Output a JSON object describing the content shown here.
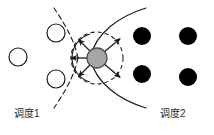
{
  "figure": {
    "background": "#ffffff",
    "width": 214,
    "height": 135
  },
  "labels": {
    "left": "调度1",
    "right": "调度2"
  },
  "colors": {
    "stroke": "#1a1a1a",
    "open_node_fill": "#ffffff",
    "filled_node_fill": "#000000",
    "center_node_fill": "#a6a6a6",
    "center_node_stroke": "#4d4d4d",
    "text": "#2b2b2b"
  },
  "nodes": {
    "open_circles": [
      {
        "id": "open-1",
        "cx": 18,
        "cy": 57,
        "r": 9
      },
      {
        "id": "open-2",
        "cx": 56,
        "cy": 33,
        "r": 9
      },
      {
        "id": "open-3",
        "cx": 56,
        "cy": 79,
        "r": 9
      }
    ],
    "filled_circles": [
      {
        "id": "filled-1",
        "cx": 142,
        "cy": 36,
        "r": 9
      },
      {
        "id": "filled-2",
        "cx": 188,
        "cy": 36,
        "r": 9
      },
      {
        "id": "filled-3",
        "cx": 142,
        "cy": 74,
        "r": 9
      },
      {
        "id": "filled-4",
        "cx": 188,
        "cy": 77,
        "r": 9
      }
    ],
    "center_circle": {
      "id": "center",
      "cx": 97,
      "cy": 58,
      "r": 10
    }
  },
  "center_ring": {
    "rx": 26,
    "ry": 26,
    "dash": "4 3"
  },
  "inner_arc": {
    "description": "solid arc left of center node",
    "rx": 25,
    "ry": 25
  },
  "arrows": [
    {
      "id": "arrow-left",
      "angle_deg": 180,
      "length": 26
    },
    {
      "id": "arrow-upper-left",
      "angle_deg": 135,
      "length": 26
    },
    {
      "id": "arrow-lower-left",
      "angle_deg": 225,
      "length": 26
    },
    {
      "id": "arrow-upper-right",
      "angle_deg": 40,
      "length": 30
    },
    {
      "id": "arrow-lower-right",
      "angle_deg": 320,
      "length": 30
    }
  ],
  "curves": {
    "solid": {
      "style": "solid",
      "description": "hyperbola-like branch opening leftward, vertex right of center"
    },
    "dashed": {
      "style": "dashed",
      "description": "hyperbola-like branch opening leftward, vertex left of solid"
    }
  }
}
